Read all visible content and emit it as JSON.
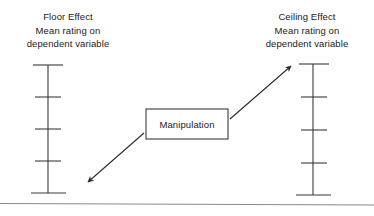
{
  "diagram": {
    "background_color": "#ffffff",
    "line_color": "#3a3a3a",
    "text_color": "#1a1a1a",
    "width": 374,
    "height": 216,
    "left_label": {
      "line1": "Floor Effect",
      "line2": "Mean rating on",
      "line3": "dependent variable"
    },
    "right_label": {
      "line1": "Ceiling Effect",
      "line2": "Mean rating on",
      "line3": "dependent variable"
    },
    "center_box": {
      "text": "Manipulation"
    },
    "left_scale": {
      "name": "floor-effect-scale",
      "tick_count": 5,
      "axis_x": 48,
      "top_y": 65,
      "bottom_y": 193
    },
    "right_scale": {
      "name": "ceiling-effect-scale",
      "tick_count": 5,
      "axis_x": 313,
      "top_y": 64,
      "bottom_y": 195
    },
    "arrows": [
      {
        "name": "arrow-to-floor",
        "direction": "down-left",
        "from": "Manipulation",
        "to": "Floor Effect scale"
      },
      {
        "name": "arrow-to-ceiling",
        "direction": "up-right",
        "from": "Manipulation",
        "to": "Ceiling Effect scale"
      }
    ],
    "footer_rule": {
      "name": "horizontal-divider",
      "y": 203
    }
  }
}
